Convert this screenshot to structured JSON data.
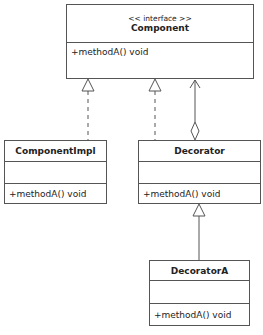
{
  "diagram": {
    "type": "uml-class-diagram",
    "classes": [
      {
        "id": "component",
        "stereotype": "<< interface >>",
        "name": "Component",
        "attributes": [],
        "methods": [
          "+methodA() void"
        ]
      },
      {
        "id": "component_impl",
        "name": "ComponentImpl",
        "attributes": [],
        "methods": [
          "+methodA() void"
        ]
      },
      {
        "id": "decorator",
        "name": "Decorator",
        "attributes": [],
        "methods": [
          "+methodA() void"
        ]
      },
      {
        "id": "decorator_a",
        "name": "DecoratorA",
        "attributes": [],
        "methods": [
          "+methodA() void"
        ]
      }
    ],
    "relationships": [
      {
        "from": "ComponentImpl",
        "to": "Component",
        "type": "realization"
      },
      {
        "from": "Decorator",
        "to": "Component",
        "type": "realization"
      },
      {
        "from": "Decorator",
        "to": "Component",
        "type": "aggregation-association"
      },
      {
        "from": "DecoratorA",
        "to": "Decorator",
        "type": "generalization"
      }
    ],
    "colors": {
      "line": "#555555",
      "background": "#ffffff",
      "text": "#222222"
    }
  }
}
